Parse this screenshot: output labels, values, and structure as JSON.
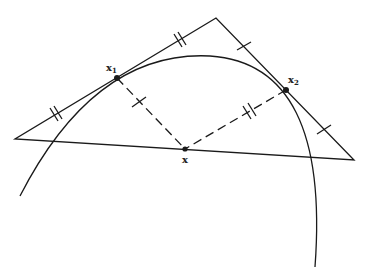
{
  "diagram": {
    "labels": {
      "x1_main": "x",
      "x1_sub": "1",
      "x2_main": "x",
      "x2_sub": "2",
      "center": "x"
    },
    "colors": {
      "stroke": "#1a1a1a",
      "background": "#ffffff"
    },
    "points": {
      "top_vertex": [
        216,
        18
      ],
      "left_vertex": [
        15,
        139
      ],
      "right_vertex": [
        354,
        160
      ],
      "x1": [
        117,
        78
      ],
      "x2": [
        286,
        90
      ],
      "x": [
        185,
        149
      ]
    }
  }
}
